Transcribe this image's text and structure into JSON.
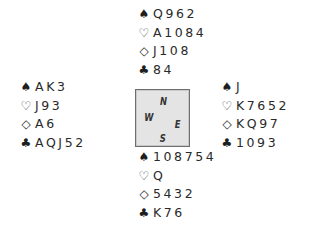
{
  "suit_symbols": {
    "spades": "♠",
    "hearts": "♡",
    "diamonds": "◇",
    "clubs": "♣"
  },
  "compass": {
    "north": "N",
    "west": "W",
    "east": "E",
    "south": "S"
  },
  "hands": {
    "north": {
      "spades": "Q962",
      "hearts": "A1084",
      "diamonds": "J108",
      "clubs": "84"
    },
    "west": {
      "spades": "AK3",
      "hearts": "J93",
      "diamonds": "A6",
      "clubs": "AQJ52"
    },
    "east": {
      "spades": "J",
      "hearts": "K7652",
      "diamonds": "KQ97",
      "clubs": "1093"
    },
    "south": {
      "spades": "108754",
      "hearts": "Q",
      "diamonds": "5432",
      "clubs": "K76"
    }
  },
  "colors": {
    "text": "#2a2a2a",
    "compass_fill": "#e4e4e4",
    "compass_border": "#6e6e6e"
  }
}
